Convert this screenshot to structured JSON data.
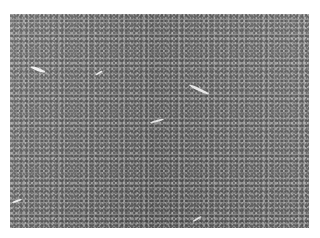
{
  "image": {
    "description": "Grayscale histology micrograph of densely packed small round cells",
    "background_color": "#ffffff",
    "tissue_tone": "#8e8e8e",
    "region": {
      "x": 10,
      "y": 14,
      "width": 299,
      "height": 214
    },
    "vessel_gaps": [
      {
        "x": 30,
        "y": 68,
        "w": 16,
        "h": 3,
        "rot": "20deg"
      },
      {
        "x": 188,
        "y": 88,
        "w": 22,
        "h": 3,
        "rot": "25deg"
      },
      {
        "x": 95,
        "y": 72,
        "w": 8,
        "h": 2,
        "rot": "-30deg"
      },
      {
        "x": 150,
        "y": 120,
        "w": 14,
        "h": 2,
        "rot": "-15deg"
      },
      {
        "x": 192,
        "y": 218,
        "w": 10,
        "h": 2,
        "rot": "-30deg"
      },
      {
        "x": 12,
        "y": 200,
        "w": 10,
        "h": 2,
        "rot": "-20deg"
      }
    ]
  }
}
